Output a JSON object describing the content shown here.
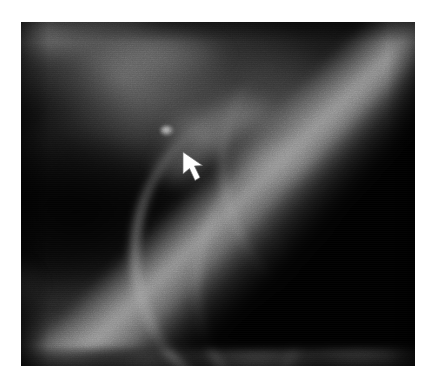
{
  "document": {
    "background_color": "#ffffff",
    "figure_kind": "mammogram",
    "modality_label": "",
    "caption": ""
  },
  "image": {
    "name": "mammogram-radiograph",
    "x": 21,
    "y": 22,
    "width": 394,
    "height": 344,
    "colorspace": "grayscale",
    "background_color": "#050505",
    "border_color": "#ffffff",
    "description": "Dark grayscale mammographic view of breast tissue with heterogeneous fibroglandular density; a bright curvilinear skin/parenchymal edge sweeps diagonally across the upper right with a black air region beyond it, and curved fibrous bands arc through the lower right.",
    "regions": [
      {
        "name": "upper-left-glandular-swirl",
        "description": "Moderately bright swirling fibroglandular tissue along the top-left",
        "brightness": "medium"
      },
      {
        "name": "central-dark-fat-pocket",
        "description": "Large low-density dark region occupying the mid and lower left",
        "brightness": "very-dark"
      },
      {
        "name": "skin-line-band",
        "description": "Bright diagonal skin / tissue border running from upper-left toward lower-right in the upper right quadrant",
        "brightness": "bright"
      },
      {
        "name": "air-corner",
        "description": "Pure black triangular area of air outside the breast at the top-right corner",
        "brightness": "black"
      },
      {
        "name": "fibrous-arc-bands",
        "description": "Curved bright fibrous/ductal bands arcing through the right and lower-right portion",
        "brightness": "bright"
      },
      {
        "name": "lower-trabecular-texture",
        "description": "Mottled mid-gray trabecular texture across the bottom of the field",
        "brightness": "medium-dark"
      }
    ]
  },
  "annotation": {
    "name": "lesion-pointer-arrow",
    "type": "arrow",
    "color": "#ffffff",
    "outline_color": "#6e6e6e",
    "direction": "up-left",
    "tip_x": 183,
    "tip_y": 152,
    "tail_x": 203,
    "tail_y": 182,
    "label": "",
    "points_to": "small-bright-lesion"
  },
  "finding": {
    "name": "indicated-lesion",
    "x": 167,
    "y": 131,
    "description": "Small focal bright density indicated by the arrow tip",
    "brightness": "bright"
  }
}
